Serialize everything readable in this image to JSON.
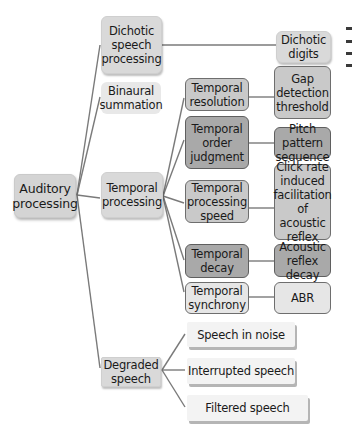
{
  "diagram": {
    "title": "Auditory processing",
    "root": {
      "label": "Auditory\nprocessing"
    },
    "level1": [
      {
        "id": "dichotic",
        "label": "Dichotic speech processing"
      },
      {
        "id": "binaural",
        "label": "Binaural summation"
      },
      {
        "id": "temporal",
        "label": "Temporal processing"
      },
      {
        "id": "degraded",
        "label": "Degraded speech"
      }
    ],
    "dichotic_children": [
      {
        "label": "Dichotic digits"
      }
    ],
    "temporal_children": [
      {
        "label": "Temporal resolution",
        "test": "Gap detection threshold"
      },
      {
        "label": "Temporal order judgment",
        "test": "Pitch pattern sequence"
      },
      {
        "label": "Temporal processing speed",
        "test": "Click rate induced facilitation of acoustic reflex"
      },
      {
        "label": "Temporal decay",
        "test": "Acoustic reflex decay"
      },
      {
        "label": "Temporal synchrony",
        "test": "ABR"
      }
    ],
    "degraded_children": [
      {
        "label": "Speech in noise"
      },
      {
        "label": "Interrupted speech"
      },
      {
        "label": "Filtered speech"
      }
    ]
  }
}
